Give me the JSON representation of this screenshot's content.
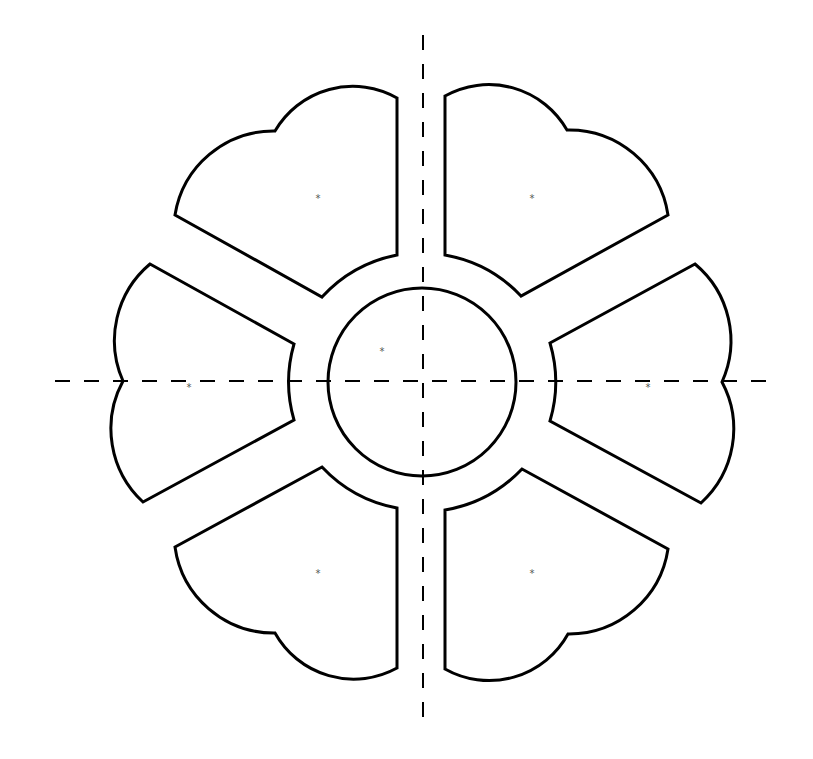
{
  "diagram": {
    "type": "flower-template",
    "colors": {
      "stroke": "#000000",
      "background": "#ffffff",
      "marker": "#555555"
    },
    "center": {
      "x": 422,
      "y": 381,
      "radius": 95
    },
    "axes": {
      "vertical": {
        "x": 423,
        "y1": 35,
        "y2": 730,
        "style": "dashed"
      },
      "horizontal": {
        "y": 381,
        "x1": 55,
        "x2": 778,
        "style": "dashed"
      }
    },
    "petals": [
      {
        "id": "top-left",
        "marker": "*",
        "marker_pos": [
          318,
          199
        ]
      },
      {
        "id": "top-right",
        "marker": "*",
        "marker_pos": [
          532,
          199
        ]
      },
      {
        "id": "left",
        "marker": "*",
        "marker_pos": [
          189,
          388
        ]
      },
      {
        "id": "right",
        "marker": "*",
        "marker_pos": [
          648,
          388
        ]
      },
      {
        "id": "bottom-left",
        "marker": "*",
        "marker_pos": [
          318,
          574
        ]
      },
      {
        "id": "bottom-right",
        "marker": "*",
        "marker_pos": [
          532,
          574
        ]
      }
    ],
    "center_marker": {
      "marker": "*",
      "marker_pos": [
        382,
        352
      ]
    }
  }
}
